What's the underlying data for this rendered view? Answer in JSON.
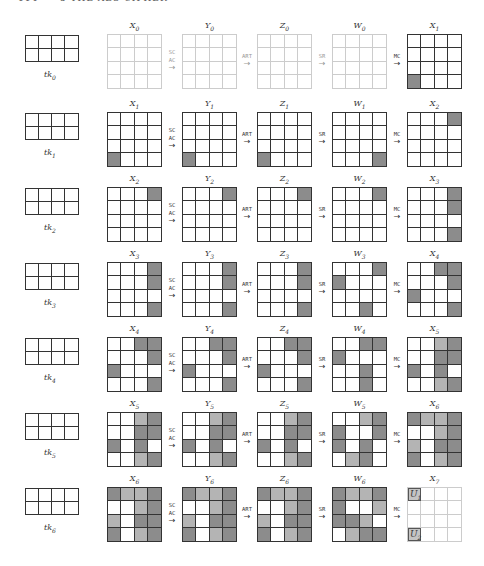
{
  "header": {
    "page_number": "114",
    "running_title": "5 THE AES CIPHER"
  },
  "colors": {
    "dark": "#8c8c8c",
    "light": "#b4b4b4",
    "grid_line": "#333333",
    "faint_line": "#cccccc"
  },
  "operations": {
    "sc_ac": [
      "SC",
      "AC"
    ],
    "art": "ART",
    "sr": "SR",
    "mc": "MC",
    "arrow": "→"
  },
  "rounds": [
    {
      "key_label": "tk",
      "key_index": "0",
      "states": [
        {
          "name": "X",
          "idx": "0",
          "faint": true,
          "cells": [
            "W",
            "W",
            "W",
            "W",
            "W",
            "W",
            "W",
            "W",
            "W",
            "W",
            "W",
            "W",
            "W",
            "W",
            "W",
            "W"
          ]
        },
        {
          "name": "Y",
          "idx": "0",
          "faint": true,
          "cells": [
            "W",
            "W",
            "W",
            "W",
            "W",
            "W",
            "W",
            "W",
            "W",
            "W",
            "W",
            "W",
            "W",
            "W",
            "W",
            "W"
          ]
        },
        {
          "name": "Z",
          "idx": "0",
          "faint": true,
          "cells": [
            "W",
            "W",
            "W",
            "W",
            "W",
            "W",
            "W",
            "W",
            "W",
            "W",
            "W",
            "W",
            "W",
            "W",
            "W",
            "W"
          ]
        },
        {
          "name": "W",
          "idx": "0",
          "faint": true,
          "cells": [
            "W",
            "W",
            "W",
            "W",
            "W",
            "W",
            "W",
            "W",
            "W",
            "W",
            "W",
            "W",
            "W",
            "W",
            "W",
            "W"
          ]
        },
        {
          "name": "X",
          "idx": "1",
          "faint": false,
          "cells": [
            "W",
            "W",
            "W",
            "W",
            "W",
            "W",
            "W",
            "W",
            "W",
            "W",
            "W",
            "W",
            "D",
            "W",
            "W",
            "W"
          ]
        }
      ]
    },
    {
      "key_label": "tk",
      "key_index": "1",
      "states": [
        {
          "name": "X",
          "idx": "1",
          "faint": false,
          "cells": [
            "W",
            "W",
            "W",
            "W",
            "W",
            "W",
            "W",
            "W",
            "W",
            "W",
            "W",
            "W",
            "D",
            "W",
            "W",
            "W"
          ]
        },
        {
          "name": "Y",
          "idx": "1",
          "faint": false,
          "cells": [
            "W",
            "W",
            "W",
            "W",
            "W",
            "W",
            "W",
            "W",
            "W",
            "W",
            "W",
            "W",
            "D",
            "W",
            "W",
            "W"
          ]
        },
        {
          "name": "Z",
          "idx": "1",
          "faint": false,
          "cells": [
            "W",
            "W",
            "W",
            "W",
            "W",
            "W",
            "W",
            "W",
            "W",
            "W",
            "W",
            "W",
            "D",
            "W",
            "W",
            "W"
          ]
        },
        {
          "name": "W",
          "idx": "1",
          "faint": false,
          "cells": [
            "W",
            "W",
            "W",
            "W",
            "W",
            "W",
            "W",
            "W",
            "W",
            "W",
            "W",
            "W",
            "W",
            "W",
            "W",
            "D"
          ]
        },
        {
          "name": "X",
          "idx": "2",
          "faint": false,
          "cells": [
            "W",
            "W",
            "W",
            "D",
            "W",
            "W",
            "W",
            "W",
            "W",
            "W",
            "W",
            "W",
            "W",
            "W",
            "W",
            "W"
          ]
        }
      ]
    },
    {
      "key_label": "tk",
      "key_index": "2",
      "states": [
        {
          "name": "X",
          "idx": "2",
          "faint": false,
          "cells": [
            "W",
            "W",
            "W",
            "D",
            "W",
            "W",
            "W",
            "W",
            "W",
            "W",
            "W",
            "W",
            "W",
            "W",
            "W",
            "W"
          ]
        },
        {
          "name": "Y",
          "idx": "2",
          "faint": false,
          "cells": [
            "W",
            "W",
            "W",
            "D",
            "W",
            "W",
            "W",
            "W",
            "W",
            "W",
            "W",
            "W",
            "W",
            "W",
            "W",
            "W"
          ]
        },
        {
          "name": "Z",
          "idx": "2",
          "faint": false,
          "cells": [
            "W",
            "W",
            "W",
            "D",
            "W",
            "W",
            "W",
            "W",
            "W",
            "W",
            "W",
            "W",
            "W",
            "W",
            "W",
            "W"
          ]
        },
        {
          "name": "W",
          "idx": "2",
          "faint": false,
          "cells": [
            "W",
            "W",
            "W",
            "D",
            "W",
            "W",
            "W",
            "W",
            "W",
            "W",
            "W",
            "W",
            "W",
            "W",
            "W",
            "W"
          ]
        },
        {
          "name": "X",
          "idx": "3",
          "faint": false,
          "cells": [
            "W",
            "W",
            "W",
            "D",
            "W",
            "W",
            "W",
            "D",
            "W",
            "W",
            "W",
            "W",
            "W",
            "W",
            "W",
            "D"
          ]
        }
      ]
    },
    {
      "key_label": "tk",
      "key_index": "3",
      "states": [
        {
          "name": "X",
          "idx": "3",
          "faint": false,
          "cells": [
            "W",
            "W",
            "W",
            "D",
            "W",
            "W",
            "W",
            "D",
            "W",
            "W",
            "W",
            "W",
            "W",
            "W",
            "W",
            "D"
          ]
        },
        {
          "name": "Y",
          "idx": "3",
          "faint": false,
          "cells": [
            "W",
            "W",
            "W",
            "D",
            "W",
            "W",
            "W",
            "D",
            "W",
            "W",
            "W",
            "W",
            "W",
            "W",
            "W",
            "D"
          ]
        },
        {
          "name": "Z",
          "idx": "3",
          "faint": false,
          "cells": [
            "W",
            "W",
            "W",
            "D",
            "W",
            "W",
            "W",
            "D",
            "W",
            "W",
            "W",
            "W",
            "W",
            "W",
            "W",
            "D"
          ]
        },
        {
          "name": "W",
          "idx": "3",
          "faint": false,
          "cells": [
            "W",
            "W",
            "W",
            "D",
            "D",
            "W",
            "W",
            "W",
            "W",
            "W",
            "W",
            "W",
            "W",
            "W",
            "D",
            "W"
          ]
        },
        {
          "name": "X",
          "idx": "4",
          "faint": false,
          "cells": [
            "W",
            "W",
            "D",
            "D",
            "W",
            "W",
            "W",
            "D",
            "D",
            "W",
            "W",
            "W",
            "W",
            "W",
            "W",
            "D"
          ]
        }
      ]
    },
    {
      "key_label": "tk",
      "key_index": "4",
      "states": [
        {
          "name": "X",
          "idx": "4",
          "faint": false,
          "cells": [
            "W",
            "W",
            "D",
            "D",
            "W",
            "W",
            "W",
            "D",
            "D",
            "W",
            "W",
            "W",
            "W",
            "W",
            "W",
            "D"
          ]
        },
        {
          "name": "Y",
          "idx": "4",
          "faint": false,
          "cells": [
            "W",
            "W",
            "D",
            "D",
            "W",
            "W",
            "W",
            "D",
            "D",
            "W",
            "W",
            "W",
            "W",
            "W",
            "W",
            "D"
          ]
        },
        {
          "name": "Z",
          "idx": "4",
          "faint": false,
          "cells": [
            "W",
            "W",
            "D",
            "D",
            "W",
            "W",
            "W",
            "D",
            "D",
            "W",
            "W",
            "W",
            "W",
            "W",
            "W",
            "D"
          ]
        },
        {
          "name": "W",
          "idx": "4",
          "faint": false,
          "cells": [
            "W",
            "W",
            "D",
            "D",
            "D",
            "W",
            "W",
            "W",
            "W",
            "W",
            "D",
            "W",
            "W",
            "W",
            "D",
            "W"
          ]
        },
        {
          "name": "X",
          "idx": "5",
          "faint": false,
          "cells": [
            "W",
            "W",
            "L",
            "D",
            "W",
            "W",
            "D",
            "D",
            "D",
            "W",
            "D",
            "W",
            "W",
            "W",
            "L",
            "D"
          ]
        }
      ]
    },
    {
      "key_label": "tk",
      "key_index": "5",
      "states": [
        {
          "name": "X",
          "idx": "5",
          "faint": false,
          "cells": [
            "W",
            "W",
            "L",
            "D",
            "W",
            "W",
            "D",
            "D",
            "D",
            "W",
            "D",
            "W",
            "W",
            "W",
            "L",
            "D"
          ]
        },
        {
          "name": "Y",
          "idx": "5",
          "faint": false,
          "cells": [
            "W",
            "W",
            "L",
            "D",
            "W",
            "W",
            "D",
            "D",
            "D",
            "W",
            "D",
            "W",
            "W",
            "W",
            "L",
            "D"
          ]
        },
        {
          "name": "Z",
          "idx": "5",
          "faint": false,
          "cells": [
            "W",
            "W",
            "L",
            "D",
            "W",
            "W",
            "D",
            "D",
            "D",
            "W",
            "D",
            "W",
            "W",
            "W",
            "L",
            "D"
          ]
        },
        {
          "name": "W",
          "idx": "5",
          "faint": false,
          "cells": [
            "W",
            "W",
            "L",
            "D",
            "D",
            "W",
            "W",
            "D",
            "D",
            "W",
            "D",
            "W",
            "W",
            "L",
            "D",
            "W"
          ]
        },
        {
          "name": "X",
          "idx": "6",
          "faint": false,
          "cells": [
            "D",
            "L",
            "L",
            "D",
            "W",
            "W",
            "L",
            "D",
            "L",
            "W",
            "D",
            "D",
            "D",
            "W",
            "L",
            "D"
          ]
        }
      ]
    },
    {
      "key_label": "tk",
      "key_index": "6",
      "states": [
        {
          "name": "X",
          "idx": "6",
          "faint": false,
          "cells": [
            "D",
            "L",
            "L",
            "D",
            "W",
            "W",
            "L",
            "D",
            "L",
            "W",
            "D",
            "D",
            "D",
            "W",
            "L",
            "D"
          ]
        },
        {
          "name": "Y",
          "idx": "6",
          "faint": false,
          "cells": [
            "D",
            "L",
            "L",
            "D",
            "W",
            "W",
            "L",
            "D",
            "L",
            "W",
            "D",
            "D",
            "D",
            "W",
            "L",
            "D"
          ]
        },
        {
          "name": "Z",
          "idx": "6",
          "faint": false,
          "cells": [
            "D",
            "L",
            "L",
            "D",
            "W",
            "W",
            "L",
            "D",
            "L",
            "W",
            "D",
            "D",
            "D",
            "W",
            "L",
            "D"
          ]
        },
        {
          "name": "W",
          "idx": "6",
          "faint": false,
          "cells": [
            "D",
            "L",
            "L",
            "D",
            "D",
            "W",
            "W",
            "L",
            "D",
            "D",
            "L",
            "W",
            "W",
            "L",
            "D",
            "D"
          ]
        },
        {
          "name": "X",
          "idx": "7",
          "faint": true,
          "cells": [
            "U1",
            "W",
            "W",
            "W",
            "W",
            "W",
            "W",
            "W",
            "W",
            "W",
            "W",
            "W",
            "U2",
            "W",
            "W",
            "W"
          ]
        }
      ]
    }
  ],
  "unknown_labels": {
    "U1": {
      "name": "U",
      "idx": "1"
    },
    "U2": {
      "name": "U",
      "idx": "2"
    }
  }
}
